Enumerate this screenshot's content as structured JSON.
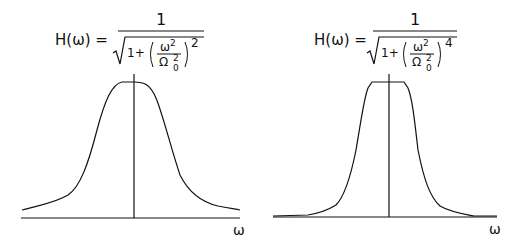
{
  "figure": {
    "panels": [
      {
        "id": "left",
        "formula": {
          "lhs": "H(ω) =",
          "numerator": "1",
          "inner_one_plus": "1+",
          "frac_num": "ω",
          "frac_num_exp": "2",
          "frac_den": "Ω",
          "frac_den_exp": "2",
          "frac_den_sub": "0",
          "outer_exp": "2",
          "latex": "H(\\omega) = \\frac{1}{\\sqrt{1+\\left(\\frac{\\omega^2}{\\Omega_0^2}\\right)^2}}"
        },
        "x_axis_label": "ω",
        "curve_shape": "smooth bell-shaped (gradual rolloff)"
      },
      {
        "id": "right",
        "formula": {
          "lhs": "H(ω) =",
          "numerator": "1",
          "inner_one_plus": "1+",
          "frac_num": "ω",
          "frac_num_exp": "2",
          "frac_den": "Ω",
          "frac_den_exp": "2",
          "frac_den_sub": "0",
          "outer_exp": "4",
          "latex": "H(\\omega) = \\frac{1}{\\sqrt{1+\\left(\\frac{\\omega^2}{\\Omega_0^2}\\right)^4}}"
        },
        "x_axis_label": "ω",
        "curve_shape": "flat-topped (sharper rolloff)"
      }
    ]
  }
}
